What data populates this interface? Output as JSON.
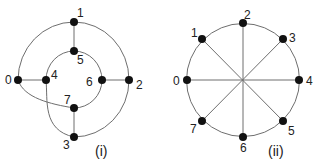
{
  "colors": {
    "edge": "#6e6e6e",
    "node": "#111111",
    "text": "#222222"
  },
  "graphs": [
    {
      "caption": "(i)",
      "nodes": [
        {
          "id": "0",
          "x": 18,
          "y": 80
        },
        {
          "id": "1",
          "x": 74,
          "y": 22
        },
        {
          "id": "2",
          "x": 129,
          "y": 80
        },
        {
          "id": "3",
          "x": 74,
          "y": 137
        },
        {
          "id": "4",
          "x": 46,
          "y": 80
        },
        {
          "id": "5",
          "x": 74,
          "y": 51
        },
        {
          "id": "6",
          "x": 102,
          "y": 80
        },
        {
          "id": "7",
          "x": 74,
          "y": 108
        }
      ],
      "edges": [
        [
          "0",
          "1"
        ],
        [
          "1",
          "2"
        ],
        [
          "2",
          "3"
        ],
        [
          "0",
          "4"
        ],
        [
          "1",
          "5"
        ],
        [
          "6",
          "2"
        ],
        [
          "7",
          "3"
        ],
        [
          "4",
          "5"
        ],
        [
          "5",
          "6"
        ],
        [
          "6",
          "7"
        ],
        [
          "0",
          "7"
        ],
        [
          "4",
          "3"
        ]
      ]
    },
    {
      "caption": "(ii)",
      "nodes": [
        {
          "id": "0",
          "x": 187,
          "y": 80
        },
        {
          "id": "1",
          "x": 202,
          "y": 39
        },
        {
          "id": "2",
          "x": 243,
          "y": 23
        },
        {
          "id": "3",
          "x": 283,
          "y": 39
        },
        {
          "id": "4",
          "x": 299,
          "y": 80
        },
        {
          "id": "5",
          "x": 283,
          "y": 121
        },
        {
          "id": "6",
          "x": 243,
          "y": 137
        },
        {
          "id": "7",
          "x": 202,
          "y": 121
        }
      ],
      "edges": [
        [
          "0",
          "1"
        ],
        [
          "1",
          "2"
        ],
        [
          "2",
          "3"
        ],
        [
          "3",
          "4"
        ],
        [
          "4",
          "5"
        ],
        [
          "5",
          "6"
        ],
        [
          "6",
          "7"
        ],
        [
          "7",
          "0"
        ],
        [
          "0",
          "4"
        ],
        [
          "1",
          "5"
        ],
        [
          "2",
          "6"
        ],
        [
          "3",
          "7"
        ]
      ]
    }
  ]
}
